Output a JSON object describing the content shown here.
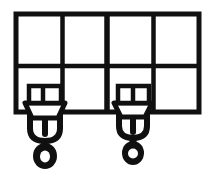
{
  "figure": {
    "style": "black-and-white line art",
    "colors": {
      "stroke": "#101010",
      "background": "#ffffff",
      "fill": "#ffffff"
    },
    "canvas": {
      "width": 216,
      "height": 181
    }
  },
  "frame": {
    "name": "gantry-grid-frame",
    "x": 16,
    "y": 14,
    "width": 183,
    "height": 98,
    "outer_stroke": 5,
    "inner_stroke": 4,
    "columns": 4,
    "rows": 2,
    "vertical_dividers": [
      62.5,
      107,
      153.5
    ],
    "horizontal_dividers": [
      66
    ]
  },
  "hoists": [
    {
      "name": "hoist-left",
      "center_x": 45,
      "block": {
        "name": "block-box-left",
        "x": 29,
        "y": 86,
        "width": 32,
        "height": 17,
        "cells": 2,
        "divider_x": 43
      },
      "body": {
        "name": "block-body-left",
        "top_y": 103,
        "top_half_width": 20,
        "bottom_y": 118,
        "bottom_half_width": 13
      },
      "frame_u": {
        "name": "hoist-u-frame-left",
        "top_y": 106,
        "bottom_y": 141,
        "half_width": 15,
        "stroke": 6
      },
      "tongue": {
        "name": "hoist-tongue-left",
        "top_y": 108,
        "bottom_y": 134,
        "width": 6
      },
      "ring": {
        "name": "hook-ring-left",
        "center_y": 156,
        "outer_rx": 12,
        "outer_ry": 13,
        "inner_rx": 5,
        "inner_ry": 6
      },
      "stem": {
        "name": "hook-stem-left",
        "top_y": 138,
        "bottom_y": 146,
        "width": 7
      }
    },
    {
      "name": "hoist-right",
      "center_x": 133,
      "block": {
        "name": "block-box-right",
        "x": 118,
        "y": 86,
        "width": 31,
        "height": 17,
        "cells": 2,
        "divider_x": 133
      },
      "body": {
        "name": "block-body-right",
        "top_y": 103,
        "top_half_width": 19,
        "bottom_y": 117,
        "bottom_half_width": 12
      },
      "frame_u": {
        "name": "hoist-u-frame-right",
        "top_y": 101,
        "bottom_y": 138,
        "half_width": 14,
        "stroke": 6
      },
      "tongue": {
        "name": "hoist-tongue-right",
        "top_y": 108,
        "bottom_y": 132,
        "width": 6
      },
      "ring": {
        "name": "hook-ring-right",
        "center_y": 153,
        "outer_rx": 11,
        "outer_ry": 12,
        "inner_rx": 5,
        "inner_ry": 5
      },
      "stem": {
        "name": "hook-stem-right",
        "top_y": 135,
        "bottom_y": 143,
        "width": 7
      }
    }
  ],
  "labels": {
    "alt_text": "Line drawing of an overhead crane beam divided into eight rectangular panels with two hoist blocks and hooks suspended beneath it."
  }
}
